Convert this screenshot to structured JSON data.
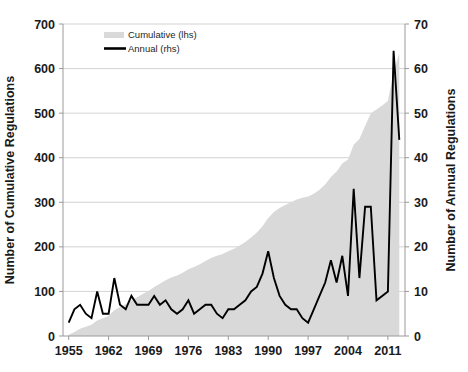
{
  "chart_data": {
    "type": "area",
    "title": "",
    "subtitle": "",
    "xlabel": "",
    "ylabel": "Number of Cumulative Regulations",
    "y2label": "Number of Annual Regulations",
    "grid": true,
    "legend_position": "top-left",
    "xlim": [
      1954,
      2014
    ],
    "ylim": [
      0,
      700
    ],
    "y2lim": [
      0,
      70
    ],
    "xticks": [
      1955,
      1962,
      1969,
      1976,
      1983,
      1990,
      1997,
      2004,
      2011
    ],
    "yticks": [
      0,
      100,
      200,
      300,
      400,
      500,
      600,
      700
    ],
    "y2ticks": [
      0,
      10,
      20,
      30,
      40,
      50,
      60,
      70
    ],
    "legend": [
      {
        "label": "Cumulative (lhs)",
        "marker": "area-swatch",
        "color": "#d9d9d9"
      },
      {
        "label": "Annual (rhs)",
        "marker": "line",
        "color": "#000000"
      }
    ],
    "x": [
      1955,
      1956,
      1957,
      1958,
      1959,
      1960,
      1961,
      1962,
      1963,
      1964,
      1965,
      1966,
      1967,
      1968,
      1969,
      1970,
      1971,
      1972,
      1973,
      1974,
      1975,
      1976,
      1977,
      1978,
      1979,
      1980,
      1981,
      1982,
      1983,
      1984,
      1985,
      1986,
      1987,
      1988,
      1989,
      1990,
      1991,
      1992,
      1993,
      1994,
      1995,
      1996,
      1997,
      1998,
      1999,
      2000,
      2001,
      2002,
      2003,
      2004,
      2005,
      2006,
      2007,
      2008,
      2009,
      2010,
      2011,
      2012,
      2013
    ],
    "series": [
      {
        "name": "Cumulative (lhs)",
        "axis": "left",
        "type": "area",
        "color": "#d9d9d9",
        "values": [
          3,
          9,
          16,
          21,
          25,
          35,
          40,
          45,
          58,
          65,
          71,
          80,
          87,
          94,
          101,
          110,
          117,
          125,
          131,
          136,
          142,
          150,
          155,
          161,
          168,
          175,
          180,
          184,
          190,
          196,
          203,
          211,
          221,
          232,
          246,
          265,
          278,
          287,
          294,
          300,
          306,
          310,
          313,
          319,
          328,
          340,
          357,
          369,
          387,
          396,
          429,
          442,
          471,
          500,
          508,
          517,
          527,
          591,
          635
        ]
      },
      {
        "name": "Annual (rhs)",
        "axis": "right",
        "type": "line",
        "color": "#000000",
        "values": [
          3,
          6,
          7,
          5,
          4,
          10,
          5,
          5,
          13,
          7,
          6,
          9,
          7,
          7,
          7,
          9,
          7,
          8,
          6,
          5,
          6,
          8,
          5,
          6,
          7,
          7,
          5,
          4,
          6,
          6,
          7,
          8,
          10,
          11,
          14,
          19,
          13,
          9,
          7,
          6,
          6,
          4,
          3,
          6,
          9,
          12,
          17,
          12,
          18,
          9,
          33,
          13,
          29,
          29,
          8,
          9,
          10,
          64,
          44
        ]
      }
    ]
  }
}
